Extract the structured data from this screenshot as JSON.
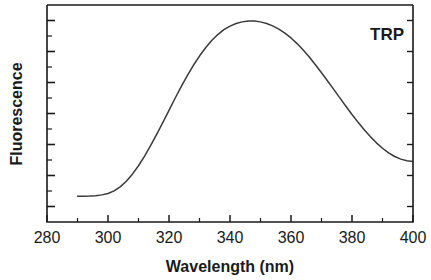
{
  "figure": {
    "background_color": "#ffffff",
    "ink_color": "#1a1a1a",
    "curve_color": "#3a3a3a"
  },
  "chart_data": {
    "type": "line",
    "title": "",
    "subtitle": "",
    "xlabel": "Wavelength  (nm)",
    "ylabel": "Fluorescence",
    "xlim": [
      280,
      400
    ],
    "ylim": [
      0,
      1.08
    ],
    "grid": false,
    "legend_position": "none",
    "x_tick_labels": [
      "280",
      "300",
      "320",
      "340",
      "360",
      "380",
      "400"
    ],
    "x_ticks": [
      280,
      300,
      320,
      340,
      360,
      380,
      400
    ],
    "x_minor_tick_interval": 10,
    "y_tick_labels": [],
    "y_major_tick_count": 7,
    "y_minor_tick_count": 6,
    "annotations": [
      {
        "text": "TRP",
        "x": 387,
        "y": 1.0
      }
    ],
    "series": [
      {
        "name": "TRP emission spectrum",
        "x": [
          290,
          292,
          294,
          296,
          298,
          300,
          302,
          304,
          306,
          308,
          310,
          312,
          314,
          316,
          318,
          320,
          322,
          324,
          326,
          328,
          330,
          332,
          334,
          336,
          338,
          340,
          342,
          344,
          346,
          348,
          350,
          352,
          354,
          356,
          358,
          360,
          362,
          364,
          366,
          368,
          370,
          372,
          374,
          376,
          378,
          380,
          382,
          384,
          386,
          388,
          390,
          392,
          394,
          396,
          398,
          400
        ],
        "y": [
          0.128,
          0.128,
          0.129,
          0.131,
          0.135,
          0.142,
          0.155,
          0.175,
          0.203,
          0.238,
          0.28,
          0.328,
          0.381,
          0.437,
          0.496,
          0.556,
          0.616,
          0.674,
          0.729,
          0.78,
          0.826,
          0.867,
          0.903,
          0.933,
          0.957,
          0.975,
          0.988,
          0.996,
          1.0,
          1.0,
          0.996,
          0.988,
          0.976,
          0.96,
          0.94,
          0.916,
          0.888,
          0.856,
          0.821,
          0.783,
          0.743,
          0.702,
          0.66,
          0.618,
          0.576,
          0.535,
          0.496,
          0.459,
          0.425,
          0.394,
          0.367,
          0.344,
          0.326,
          0.313,
          0.305,
          0.301
        ]
      }
    ]
  },
  "axis_labels": {
    "x_title": "Wavelength  (nm)",
    "y_title": "Fluorescence"
  }
}
